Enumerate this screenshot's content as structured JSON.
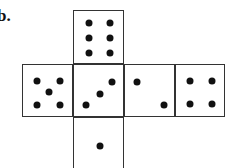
{
  "label": "b.",
  "net": {
    "description": "Cube net of a die",
    "faces": [
      {
        "name": "top",
        "pips": 6
      },
      {
        "name": "left",
        "pips": 5
      },
      {
        "name": "center",
        "pips": 3
      },
      {
        "name": "center-right",
        "pips": 2
      },
      {
        "name": "right",
        "pips": 4
      },
      {
        "name": "bottom",
        "pips": 1
      }
    ]
  }
}
